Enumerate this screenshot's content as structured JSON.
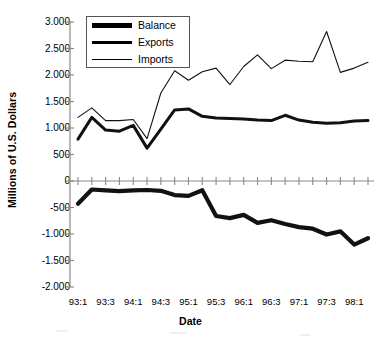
{
  "chart_data": {
    "type": "line",
    "title": "",
    "xlabel": "Date",
    "ylabel": "Millions of U.S. Dollars",
    "ylim": [
      -2000,
      3000
    ],
    "ytick_labels": [
      "3.000",
      "2.500",
      "2.000",
      "1.500",
      "1.000",
      "500",
      "0",
      "-500",
      "-1.000",
      "-1.500",
      "-2.000"
    ],
    "ytick_values": [
      3000,
      2500,
      2000,
      1500,
      1000,
      500,
      0,
      -500,
      -1000,
      -1500,
      -2000
    ],
    "grid": false,
    "legend_position": "upper-left",
    "x": [
      "93:1",
      "93:2",
      "93:3",
      "93:4",
      "94:1",
      "94:2",
      "94:3",
      "94:4",
      "95:1",
      "95:2",
      "95:3",
      "95:4",
      "96:1",
      "96:2",
      "96:3",
      "96:4",
      "97:1",
      "97:2",
      "97:3",
      "97:4",
      "98:1",
      "98:2"
    ],
    "xtick_labels": [
      "93:1",
      "93:3",
      "94:1",
      "94:3",
      "95:1",
      "95:3",
      "96:1",
      "96:3",
      "97:1",
      "97:3",
      "98:1"
    ],
    "xtick_indices": [
      0,
      2,
      4,
      6,
      8,
      10,
      12,
      14,
      16,
      18,
      20
    ],
    "series": [
      {
        "name": "Balance",
        "line_weight": "thick",
        "values": [
          -430,
          -160,
          -175,
          -190,
          -175,
          -170,
          -185,
          -265,
          -280,
          -175,
          -660,
          -700,
          -640,
          -790,
          -740,
          -810,
          -870,
          -900,
          -1010,
          -950,
          -1200,
          -1080
        ]
      },
      {
        "name": "Exports",
        "line_weight": "medium",
        "values": [
          790,
          1200,
          960,
          940,
          1050,
          620,
          980,
          1340,
          1360,
          1220,
          1190,
          1180,
          1170,
          1150,
          1140,
          1240,
          1150,
          1110,
          1090,
          1100,
          1130,
          1140
        ]
      },
      {
        "name": "Imports",
        "line_weight": "thin",
        "values": [
          1200,
          1380,
          1140,
          1140,
          1160,
          800,
          1660,
          2080,
          1900,
          2060,
          2130,
          1820,
          2160,
          2380,
          2120,
          2280,
          2260,
          2250,
          2820,
          2050,
          2130,
          2240
        ]
      }
    ]
  },
  "legend": {
    "items": [
      {
        "label": "Balance"
      },
      {
        "label": "Exports"
      },
      {
        "label": "Imports"
      }
    ]
  }
}
